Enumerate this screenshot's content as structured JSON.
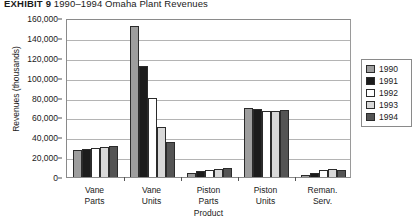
{
  "exhibit": {
    "label": "EXHIBIT 9",
    "caption": "1990–1994 Omaha Plant Revenues"
  },
  "chart_data": {
    "type": "bar",
    "title": "1990–1994 Omaha Plant Revenues",
    "xlabel": "Product",
    "ylabel": "Revenues (thousands)",
    "ylim": [
      0,
      160000
    ],
    "ytick_labels": [
      "0",
      "20,000",
      "40,000",
      "60,000",
      "80,000",
      "100,000",
      "120,000",
      "140,000",
      "160,000"
    ],
    "ytick_values": [
      0,
      20000,
      40000,
      60000,
      80000,
      100000,
      120000,
      140000,
      160000
    ],
    "grid": true,
    "legend_position": "right",
    "categories": [
      "Vane Parts",
      "Vane Units",
      "Piston Parts",
      "Piston Units",
      "Reman. Serv."
    ],
    "category_lines": [
      [
        "Vane",
        "Parts"
      ],
      [
        "Vane",
        "Units"
      ],
      [
        "Piston",
        "Parts"
      ],
      [
        "Piston",
        "Units"
      ],
      [
        "Reman.",
        "Serv."
      ]
    ],
    "series": [
      {
        "name": "1990",
        "color": "#9e9e9e",
        "values": [
          27000,
          152000,
          4000,
          69000,
          2000
        ]
      },
      {
        "name": "1991",
        "color": "#1c1c1c",
        "values": [
          28500,
          112000,
          6000,
          68000,
          4000
        ]
      },
      {
        "name": "1992",
        "color": "#ffffff",
        "values": [
          29500,
          80000,
          7000,
          66500,
          7500
        ]
      },
      {
        "name": "1993",
        "color": "#d8d8d8",
        "values": [
          30000,
          50000,
          8000,
          66000,
          8000
        ]
      },
      {
        "name": "1994",
        "color": "#545454",
        "values": [
          31000,
          35000,
          9000,
          67000,
          7500
        ]
      }
    ]
  }
}
